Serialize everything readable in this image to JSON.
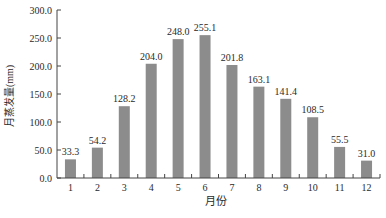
{
  "chart_data": {
    "type": "bar",
    "title": "",
    "xlabel": "月份",
    "ylabel": "月蒸发量(mm)",
    "categories": [
      "1",
      "2",
      "3",
      "4",
      "5",
      "6",
      "7",
      "8",
      "9",
      "10",
      "11",
      "12"
    ],
    "values": [
      33.3,
      54.2,
      128.2,
      204.0,
      248.0,
      255.1,
      201.8,
      163.1,
      141.4,
      108.5,
      55.5,
      31.0
    ],
    "value_labels": [
      "33.3",
      "54.2",
      "128.2",
      "204.0",
      "248.0",
      "255.1",
      "201.8",
      "163.1",
      "141.4",
      "108.5",
      "55.5",
      "31.0"
    ],
    "ylim": [
      0,
      300
    ],
    "yticks": [
      "0.0",
      "50.0",
      "100.0",
      "150.0",
      "200.0",
      "250.0",
      "300.0"
    ],
    "grid": false,
    "legend": null,
    "bar_color": "#8c8c8c"
  }
}
